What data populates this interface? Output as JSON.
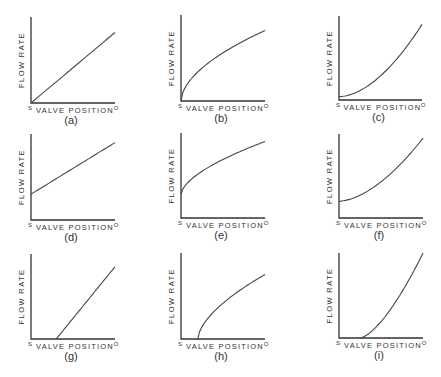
{
  "figure": {
    "axis_labels": {
      "y": "FLOW RATE",
      "x": "VALVE POSITION",
      "x_start": "S",
      "x_end": "O"
    },
    "panels": [
      {
        "id": "a",
        "caption": "(a)",
        "shape": "linear",
        "ox": 31,
        "oy": 103,
        "w": 84,
        "h": 86,
        "y0": 0.0,
        "x0": 0.0,
        "y1": 0.82,
        "exp": 1.0
      },
      {
        "id": "b",
        "caption": "(b)",
        "shape": "concave",
        "ox": 181,
        "oy": 101,
        "w": 84,
        "h": 86,
        "y0": 0.0,
        "x0": 0.0,
        "y1": 0.82,
        "exp": 0.55
      },
      {
        "id": "c",
        "caption": "(c)",
        "shape": "convex",
        "ox": 339,
        "oy": 100,
        "w": 83,
        "h": 84,
        "y0": 0.04,
        "x0": 0.0,
        "y1": 0.9,
        "exp": 1.8
      },
      {
        "id": "d",
        "caption": "(d)",
        "shape": "linear-offset",
        "ox": 31,
        "oy": 220,
        "w": 84,
        "h": 86,
        "y0": 0.3,
        "x0": 0.0,
        "y1": 0.9,
        "exp": 1.0
      },
      {
        "id": "e",
        "caption": "(e)",
        "shape": "concave-offset",
        "ox": 181,
        "oy": 218,
        "w": 84,
        "h": 85,
        "y0": 0.28,
        "x0": 0.0,
        "y1": 0.9,
        "exp": 0.6
      },
      {
        "id": "f",
        "caption": "(f)",
        "shape": "convex-offset",
        "ox": 339,
        "oy": 218,
        "w": 84,
        "h": 84,
        "y0": 0.2,
        "x0": 0.0,
        "y1": 0.95,
        "exp": 1.7
      },
      {
        "id": "g",
        "caption": "(g)",
        "shape": "linear-deadband",
        "ox": 31,
        "oy": 339,
        "w": 84,
        "h": 85,
        "y0": 0.0,
        "x0": 0.3,
        "y1": 0.85,
        "exp": 1.0
      },
      {
        "id": "h",
        "caption": "(h)",
        "shape": "concave-deadband",
        "ox": 181,
        "oy": 339,
        "w": 84,
        "h": 86,
        "y0": 0.0,
        "x0": 0.2,
        "y1": 0.75,
        "exp": 0.6
      },
      {
        "id": "i",
        "caption": "(i)",
        "shape": "convex-deadband",
        "ox": 339,
        "oy": 338,
        "w": 84,
        "h": 85,
        "y0": 0.0,
        "x0": 0.25,
        "y1": 1.0,
        "exp": 1.5
      }
    ]
  }
}
